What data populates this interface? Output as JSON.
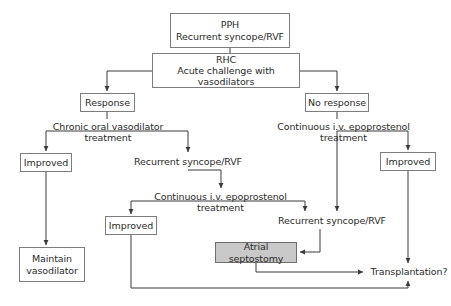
{
  "figure": {
    "type": "flowchart",
    "background_color": "#ffffff",
    "box_border_color": "#7d7d7d",
    "shaded_fill_color": "#c9c9c9",
    "text_color": "#2b2b2b",
    "edge_color": "#3a3a3a"
  },
  "nodes": {
    "pph": {
      "label": "PPH\nRecurrent syncope/RVF",
      "style": "boxed",
      "x": 170,
      "y": 13,
      "w": 120,
      "h": 35,
      "font_size": 9.5
    },
    "rhc": {
      "label": "RHC\nAcute challenge with vasodilators",
      "style": "boxed",
      "x": 152,
      "y": 53,
      "w": 148,
      "h": 35,
      "font_size": 9.5
    },
    "response": {
      "label": "Response",
      "style": "boxed",
      "x": 80,
      "y": 93,
      "w": 55,
      "h": 19,
      "font_size": 9.5
    },
    "no_response": {
      "label": "No response",
      "style": "boxed",
      "x": 305,
      "y": 93,
      "w": 64,
      "h": 19,
      "font_size": 9.5
    },
    "chronic_oral": {
      "label": "Chronic oral vasodilator\ntreatment",
      "style": "plain",
      "x": 51,
      "y": 119,
      "w": 114,
      "h": 26,
      "font_size": 9.5
    },
    "continuous_iv_right": {
      "label": "Continuous i.v. epoprostenol\ntreatment",
      "style": "plain",
      "x": 276,
      "y": 119,
      "w": 135,
      "h": 26,
      "font_size": 9.5
    },
    "improved_left": {
      "label": "Improved",
      "style": "boxed",
      "x": 20,
      "y": 153,
      "w": 52,
      "h": 19,
      "font_size": 9.5
    },
    "improved_right": {
      "label": "Improved",
      "style": "boxed",
      "x": 380,
      "y": 152,
      "w": 56,
      "h": 19,
      "font_size": 9.5
    },
    "recurrent_mid": {
      "label": "Recurrent syncope/RVF",
      "style": "plain",
      "x": 128,
      "y": 155,
      "w": 120,
      "h": 14,
      "font_size": 9.5
    },
    "continuous_iv_mid": {
      "label": "Continuous i.v. epoprostenol\ntreatment",
      "style": "plain",
      "x": 153,
      "y": 189,
      "w": 135,
      "h": 26,
      "font_size": 9.5
    },
    "improved_mid": {
      "label": "Improved",
      "style": "boxed",
      "x": 105,
      "y": 216,
      "w": 52,
      "h": 19,
      "font_size": 9.5
    },
    "recurrent_right": {
      "label": "Recurrent syncope/RVF",
      "style": "plain",
      "x": 272,
      "y": 214,
      "w": 120,
      "h": 14,
      "font_size": 9.5
    },
    "atrial_septostomy": {
      "label": "Atrial septostomy",
      "style": "shaded",
      "x": 215,
      "y": 242,
      "w": 82,
      "h": 21,
      "font_size": 9.5
    },
    "maintain_vasodilator": {
      "label": "Maintain\nvasodilator",
      "style": "boxed",
      "x": 19,
      "y": 247,
      "w": 66,
      "h": 35,
      "font_size": 9.5
    },
    "transplantation": {
      "label": "Transplantation?",
      "style": "plain",
      "x": 368,
      "y": 265,
      "w": 82,
      "h": 14,
      "font_size": 9.5
    }
  },
  "edges": [
    {
      "id": "pph-to-rhc",
      "from": "pph",
      "to": "rhc",
      "path": "M230,48 L230,53",
      "arrow": false
    },
    {
      "id": "rhc-to-response",
      "from": "rhc",
      "to": "response",
      "path": "M152,71 L107,71 L107,91",
      "arrow": true
    },
    {
      "id": "rhc-to-no-response",
      "from": "rhc",
      "to": "no_response",
      "path": "M300,71 L337,71 L337,91",
      "arrow": true
    },
    {
      "id": "response-to-chronic",
      "from": "response",
      "to": "chronic_oral",
      "path": "M107,112 L107,119",
      "arrow": false
    },
    {
      "id": "no-response-to-continuous",
      "from": "no_response",
      "to": "continuous_iv_right",
      "path": "M337,112 L337,119",
      "arrow": false
    },
    {
      "id": "chronic-to-improved-left",
      "from": "chronic_oral",
      "to": "improved_left",
      "path": "M107,131 L46,131 L46,151",
      "arrow": true
    },
    {
      "id": "chronic-to-recurrent-mid",
      "from": "chronic_oral",
      "to": "recurrent_mid",
      "path": "M107,131 L188,131 L188,152",
      "arrow": true
    },
    {
      "id": "continuous-right-to-improved-right",
      "from": "continuous_iv_right",
      "to": "improved_right",
      "path": "M337,131 L408,131 L408,150",
      "arrow": true
    },
    {
      "id": "continuous-right-to-recurrent-right",
      "from": "continuous_iv_right",
      "to": "recurrent_right",
      "path": "M337,131 L337,211",
      "arrow": true
    },
    {
      "id": "recurrent-mid-to-continuous-mid",
      "from": "recurrent_mid",
      "to": "continuous_iv_mid",
      "path": "M188,170 L221,170 L221,188",
      "arrow": true
    },
    {
      "id": "continuous-mid-to-improved-mid",
      "from": "continuous_iv_mid",
      "to": "improved_mid",
      "path": "M221,201 L131,201 L131,214",
      "arrow": true
    },
    {
      "id": "continuous-mid-to-recurrent-right",
      "from": "continuous_iv_mid",
      "to": "recurrent_right",
      "path": "M221,201 L305,201 L305,211",
      "arrow": true
    },
    {
      "id": "improved-left-to-maintain",
      "from": "improved_left",
      "to": "maintain_vasodilator",
      "path": "M46,172 L46,245",
      "arrow": true
    },
    {
      "id": "recurrent-right-to-atrial",
      "from": "recurrent_right",
      "to": "atrial_septostomy",
      "path": "M320,229 L320,252 L300,252",
      "arrow": true
    },
    {
      "id": "improved-right-to-transplantation",
      "from": "improved_right",
      "to": "transplantation",
      "path": "M408,171 L408,263",
      "arrow": true
    },
    {
      "id": "atrial-to-transplantation",
      "from": "atrial_septostomy",
      "to": "transplantation",
      "path": "M256,263 L256,272 L363,272",
      "arrow": true
    },
    {
      "id": "improved-mid-to-transplantation",
      "from": "improved_mid",
      "to": "transplantation",
      "path": "M131,235 L131,288 L408,288 L408,281",
      "arrow": true
    }
  ]
}
